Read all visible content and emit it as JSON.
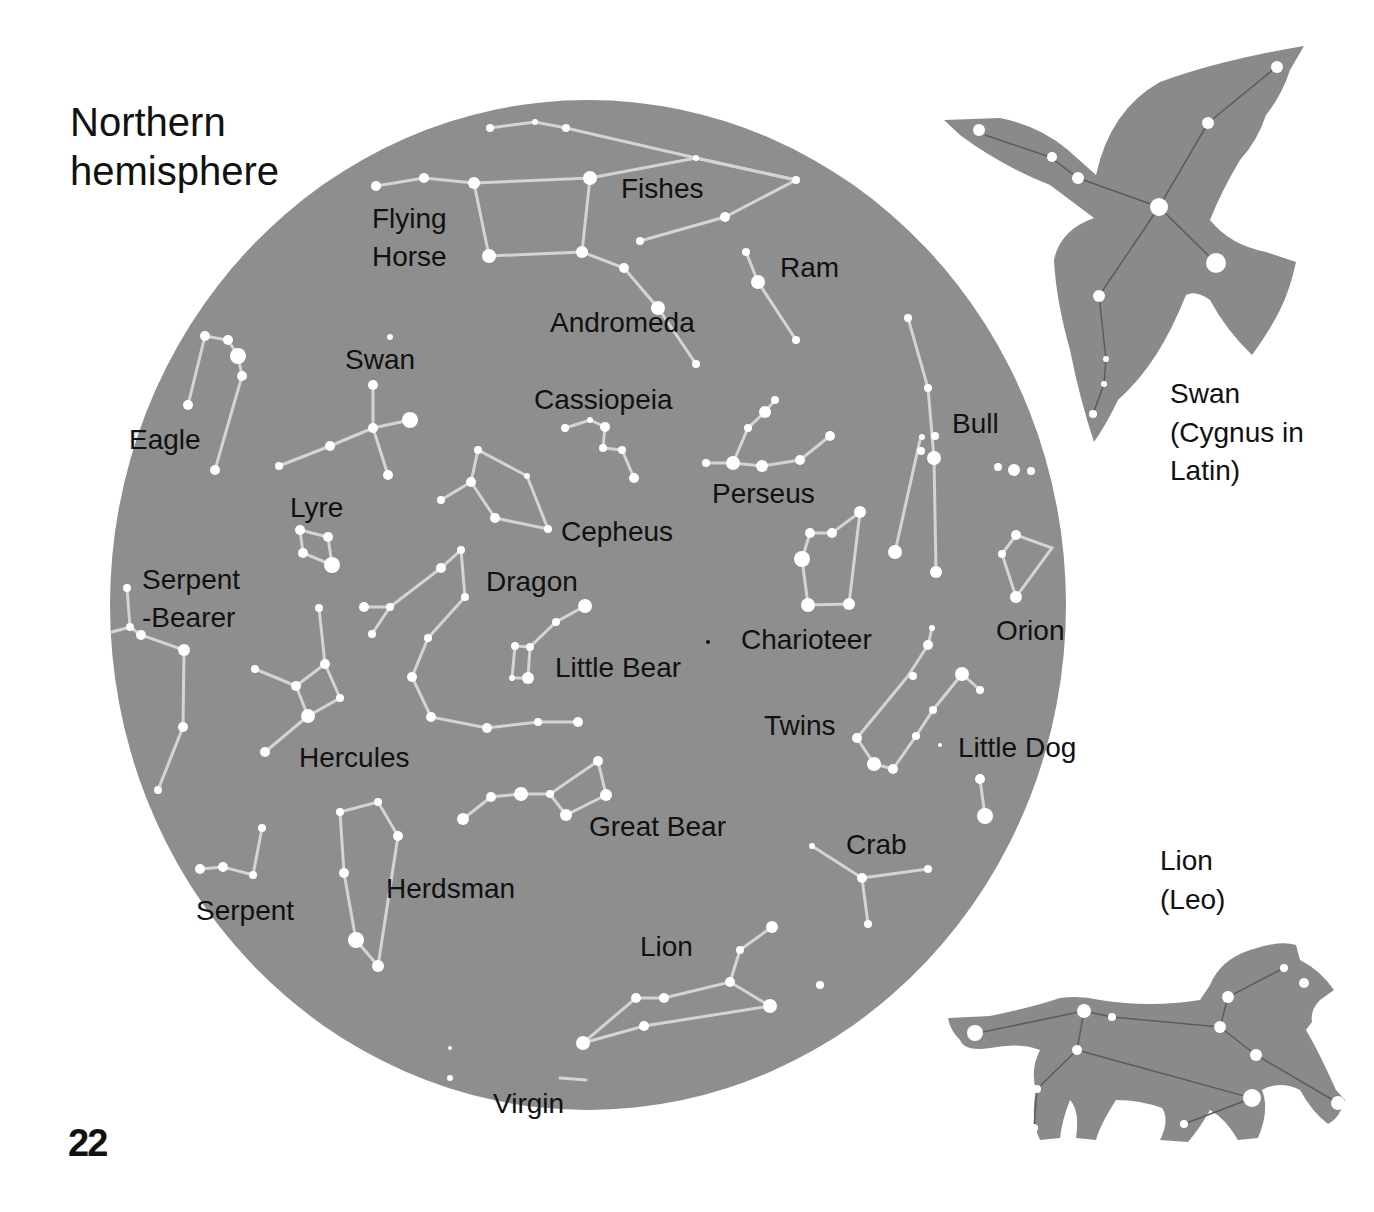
{
  "page": {
    "title_line1": "Northern",
    "title_line2": "hemisphere",
    "page_number": "22"
  },
  "colors": {
    "sky": "#8e8e8e",
    "silhouette": "#8a8a8a",
    "star": "#ffffff",
    "line": "#d6d6d6",
    "text": "#111111"
  },
  "sky_map": {
    "labels": {
      "flying_horse_1": "Flying",
      "flying_horse_2": "Horse",
      "fishes": "Fishes",
      "ram": "Ram",
      "andromeda": "Andromeda",
      "swan": "Swan",
      "cassiopeia": "Cassiopeia",
      "eagle": "Eagle",
      "bull": "Bull",
      "perseus": "Perseus",
      "lyre": "Lyre",
      "cepheus": "Cepheus",
      "serpent_bearer_1": "Serpent",
      "serpent_bearer_2": "-Bearer",
      "dragon": "Dragon",
      "charioteer": "Charioteer",
      "orion": "Orion",
      "little_bear": "Little Bear",
      "twins": "Twins",
      "little_dog": "Little Dog",
      "hercules": "Hercules",
      "great_bear": "Great Bear",
      "crab": "Crab",
      "herdsman": "Herdsman",
      "serpent": "Serpent",
      "lion": "Lion",
      "virgin": "Virgin"
    }
  },
  "insets": {
    "swan": {
      "line1": "Swan",
      "line2": "(Cygnus in",
      "line3": "Latin)"
    },
    "lion": {
      "line1": "Lion",
      "line2": "(Leo)"
    }
  }
}
